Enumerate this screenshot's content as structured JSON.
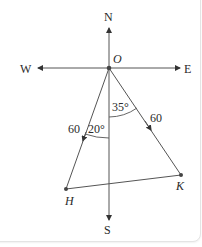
{
  "diagram": {
    "compass": {
      "north": "N",
      "south": "S",
      "east": "E",
      "west": "W"
    },
    "origin": {
      "label": "O"
    },
    "points": [
      {
        "id": "H",
        "label": "H"
      },
      {
        "id": "K",
        "label": "K"
      }
    ],
    "segments": [
      {
        "from": "O",
        "to": "H",
        "length_label": "60"
      },
      {
        "from": "O",
        "to": "K",
        "length_label": "60"
      },
      {
        "from": "H",
        "to": "K"
      }
    ],
    "angles": [
      {
        "between": "S-OH",
        "label": "20°"
      },
      {
        "between": "S-OK",
        "label": "35°"
      }
    ],
    "colors": {
      "line": "#555555",
      "text": "#2a2a2a",
      "point": "#444444"
    }
  }
}
